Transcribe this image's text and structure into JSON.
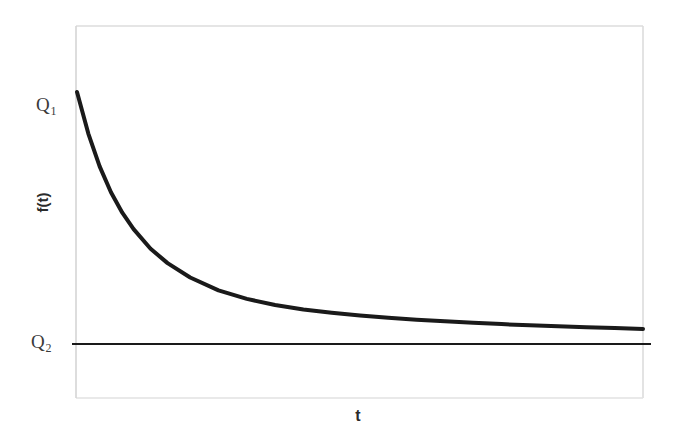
{
  "chart_data": {
    "type": "line",
    "title": "",
    "xlabel": "t",
    "ylabel": "f(t)",
    "grid": false,
    "legend": null,
    "axis_tick_labels": {
      "y": [
        {
          "text": "Q",
          "subscript": "1",
          "value": "Q1",
          "pixel_y": 92
        },
        {
          "text": "Q",
          "subscript": "2",
          "value": "Q2",
          "pixel_y": 344
        }
      ],
      "x": []
    },
    "xlim": [
      0,
      1
    ],
    "ylim": [
      0,
      1
    ],
    "annotations": [],
    "series": [
      {
        "name": "f(t)",
        "kind": "exponential-decay-curve",
        "description": "Monotonically decreasing convex curve starting at Q1 and asymptotically approaching Q2",
        "linewidth": 4,
        "color": "#1a1a1a",
        "x": [
          0.0,
          0.02,
          0.04,
          0.06,
          0.08,
          0.1,
          0.13,
          0.16,
          0.2,
          0.25,
          0.3,
          0.35,
          0.4,
          0.45,
          0.5,
          0.55,
          0.6,
          0.65,
          0.7,
          0.75,
          0.8,
          0.85,
          0.9,
          0.95,
          1.0
        ],
        "y": [
          1.0,
          0.835,
          0.705,
          0.602,
          0.521,
          0.456,
          0.378,
          0.321,
          0.264,
          0.213,
          0.179,
          0.155,
          0.137,
          0.124,
          0.113,
          0.104,
          0.096,
          0.09,
          0.084,
          0.079,
          0.074,
          0.07,
          0.066,
          0.063,
          0.06
        ]
      },
      {
        "name": "asymptote",
        "kind": "horizontal-line",
        "description": "Horizontal asymptote line at level Q2",
        "linewidth": 2,
        "color": "#1a1a1a",
        "x": [
          0.0,
          1.0
        ],
        "y": [
          0.0,
          0.0
        ]
      }
    ]
  },
  "labels": {
    "q1_text": "Q",
    "q1_sub": "1",
    "q2_text": "Q",
    "q2_sub": "2",
    "ylabel": "f(t)",
    "xlabel": "t"
  },
  "colors": {
    "curve": "#1a1a1a",
    "asymptote": "#1a1a1a",
    "frame": "#d9d9d9",
    "label_text": "#3a3a3a",
    "axis_label_text": "#2b2b2b",
    "background": "#ffffff"
  }
}
